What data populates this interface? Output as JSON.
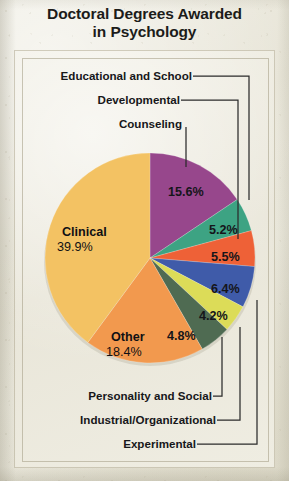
{
  "title": {
    "line1": "Doctoral Degrees Awarded",
    "line2": "in Psychology"
  },
  "chart_data": {
    "type": "pie",
    "title": "Doctoral Degrees Awarded in Psychology",
    "subtitle": "",
    "xlabel": "",
    "ylabel": "",
    "legend_position": "none",
    "grid": false,
    "units": "percent",
    "start_angle_deg": 0,
    "direction": "clockwise",
    "categories": [
      "Counseling",
      "Educational and School",
      "Developmental",
      "Experimental",
      "Industrial/Organizational",
      "Personality and Social",
      "Other",
      "Clinical"
    ],
    "values": [
      15.6,
      5.2,
      5.5,
      6.4,
      4.2,
      4.8,
      18.4,
      39.9
    ],
    "labels": [
      "15.6%",
      "5.2%",
      "5.5%",
      "6.4%",
      "4.2%",
      "4.8%",
      "18.4%",
      "39.9%"
    ],
    "colors": [
      "#97478C",
      "#3DA383",
      "#EE6137",
      "#3F5BA9",
      "#DCDC58",
      "#4F6B52",
      "#F2994E",
      "#F3C263"
    ],
    "slices": [
      {
        "name": "Counseling",
        "value": 15.6,
        "label": "15.6%",
        "color": "#97478C",
        "label_placement": "inside"
      },
      {
        "name": "Educational and School",
        "value": 5.2,
        "label": "5.2%",
        "color": "#3DA383",
        "label_placement": "inside"
      },
      {
        "name": "Developmental",
        "value": 5.5,
        "label": "5.5%",
        "color": "#EE6137",
        "label_placement": "inside"
      },
      {
        "name": "Experimental",
        "value": 6.4,
        "label": "6.4%",
        "color": "#3F5BA9",
        "label_placement": "inside"
      },
      {
        "name": "Industrial/Organizational",
        "value": 4.2,
        "label": "4.2%",
        "color": "#DCDC58",
        "label_placement": "inside"
      },
      {
        "name": "Personality and Social",
        "value": 4.8,
        "label": "4.8%",
        "color": "#4F6B52",
        "label_placement": "inside"
      },
      {
        "name": "Other",
        "value": 18.4,
        "label": "18.4%",
        "color": "#F2994E",
        "label_placement": "inside-named"
      },
      {
        "name": "Clinical",
        "value": 39.9,
        "label": "39.9%",
        "color": "#F3C263",
        "label_placement": "inside-named"
      }
    ]
  },
  "callout_labels": {
    "educational_and_school": "Educational and School",
    "developmental": "Developmental",
    "counseling": "Counseling",
    "personality_and_social": "Personality and Social",
    "industrial_organizational": "Industrial/Organizational",
    "experimental": "Experimental"
  },
  "inside_labels": {
    "clinical_name": "Clinical",
    "clinical_value": "39.9%",
    "other_name": "Other",
    "other_value": "18.4%",
    "counseling_value": "15.6%",
    "educational_value": "5.2%",
    "developmental_value": "5.5%",
    "experimental_value": "6.4%",
    "industrial_value": "4.2%",
    "personality_value": "4.8%"
  },
  "colors": {
    "leader_line": "#2b2b2b",
    "text": "#17171a",
    "paper": "#ece9dd"
  }
}
